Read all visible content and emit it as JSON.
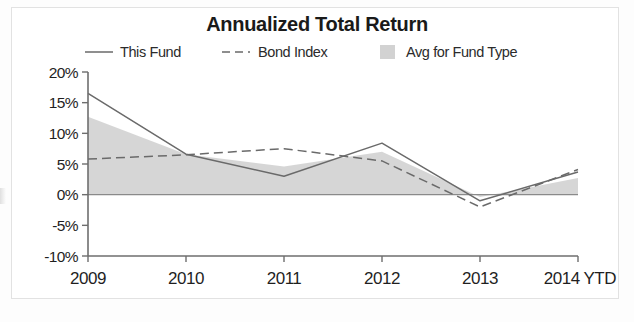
{
  "chart_data": {
    "type": "line",
    "title": "Annualized Total Return",
    "xlabel": "",
    "ylabel": "",
    "categories": [
      "2009",
      "2010",
      "2011",
      "2012",
      "2013",
      "2014 YTD"
    ],
    "ylim": [
      -10,
      20
    ],
    "yticks": [
      20,
      15,
      10,
      5,
      0,
      -5,
      -10
    ],
    "ytick_labels": [
      "20%",
      "15%",
      "10%",
      "5%",
      "0%",
      "-5%",
      "-10%"
    ],
    "grid": false,
    "legend_position": "top",
    "series": [
      {
        "name": "This Fund",
        "style": "solid-line",
        "color": "#6a6a6a",
        "values": [
          16.5,
          6.6,
          3.0,
          8.4,
          -1.0,
          3.7
        ]
      },
      {
        "name": "Bond Index",
        "style": "dashed-line",
        "color": "#6a6a6a",
        "values": [
          5.8,
          6.5,
          7.5,
          5.5,
          -2.0,
          4.1
        ]
      },
      {
        "name": "Avg for Fund Type",
        "style": "filled-area",
        "color": "#d2d2d2",
        "values": [
          12.7,
          6.6,
          4.6,
          7.0,
          -0.4,
          2.7
        ]
      }
    ]
  },
  "legend": {
    "items": [
      {
        "label": "This Fund",
        "marker": "solid-line-marker"
      },
      {
        "label": "Bond Index",
        "marker": "dashed-line-marker"
      },
      {
        "label": "Avg for Fund Type",
        "marker": "square-swatch-marker"
      }
    ]
  },
  "axis": {
    "y_labels": [
      "20%",
      "15%",
      "10%",
      "5%",
      "0%",
      "-5%",
      "-10%"
    ],
    "x_labels": [
      "2009",
      "2010",
      "2011",
      "2012",
      "2013",
      "2014 YTD"
    ]
  }
}
